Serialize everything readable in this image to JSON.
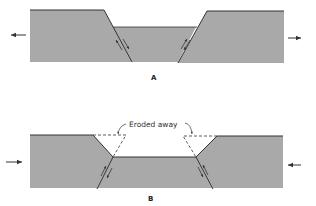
{
  "diagram": {
    "colors": {
      "rock_fill": "#a9a9a9",
      "edge": "#333333",
      "background": "#ffffff"
    },
    "panels": [
      {
        "id": "A",
        "label": "A",
        "type": "graben-normal-faults",
        "arrows": [
          "arrow-left (extension)",
          "arrow-right (extension)"
        ]
      },
      {
        "id": "B",
        "label": "B",
        "type": "ramp-valley-reverse-faults",
        "arrows": [
          "arrow-right (compression)",
          "arrow-left (compression)"
        ],
        "annotation": "Eroded away"
      }
    ]
  }
}
